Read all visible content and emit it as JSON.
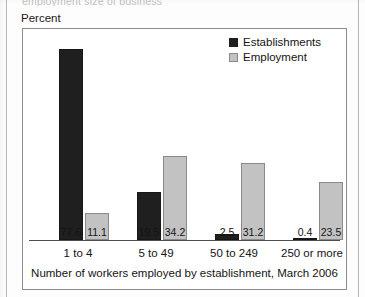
{
  "page": {
    "clipped_heading": "employment size of business",
    "unit_label": "Percent"
  },
  "legend": {
    "position": "top-right",
    "entries": [
      {
        "label": "Establishments",
        "swatch": "dark-square-icon",
        "color": "#1f1f1f"
      },
      {
        "label": "Employment",
        "swatch": "light-square-icon",
        "color": "#c2c2c2"
      }
    ]
  },
  "chart_data": {
    "type": "bar",
    "title": "",
    "subtitle": "",
    "xlabel": "Number of workers employed by establishment, March 2006",
    "ylabel": "Percent",
    "ylim": [
      0,
      80
    ],
    "grid": false,
    "legend_position": "top-right",
    "categories": [
      "1 to 4",
      "5 to 49",
      "50 to 249",
      "250 or more"
    ],
    "series": [
      {
        "name": "Establishments",
        "color": "#1f1f1f",
        "values": [
          77.6,
          19.5,
          2.5,
          0.4
        ],
        "labels": [
          "77.6",
          "19.5",
          "2.5",
          "0.4"
        ]
      },
      {
        "name": "Employment",
        "color": "#c2c2c2",
        "values": [
          11.1,
          34.2,
          31.2,
          23.5
        ],
        "labels": [
          "11.1",
          "34.2",
          "31.2",
          "23.5"
        ]
      }
    ]
  }
}
